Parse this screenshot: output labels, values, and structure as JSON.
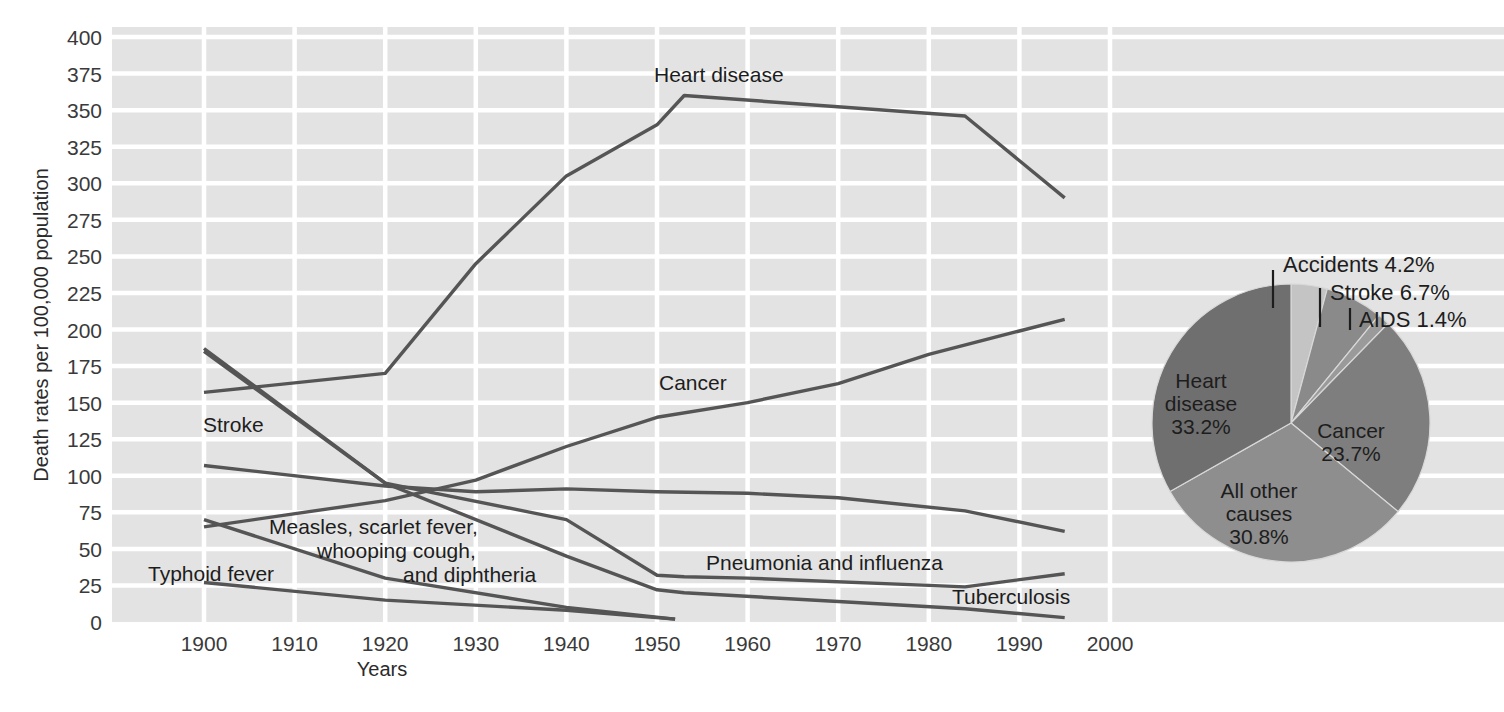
{
  "chart_data": [
    {
      "type": "line",
      "title": "",
      "xlabel": "Years",
      "ylabel": "Death rates per 100,000 population",
      "xlim": [
        1896,
        2004
      ],
      "ylim": [
        0,
        400
      ],
      "grid": true,
      "legend_position": "inline-labels",
      "xticks": [
        1900,
        1910,
        1920,
        1930,
        1940,
        1950,
        1960,
        1970,
        1980,
        1990,
        2000
      ],
      "yticks": [
        0,
        25,
        50,
        75,
        100,
        125,
        150,
        175,
        200,
        225,
        250,
        275,
        300,
        325,
        350,
        375,
        400
      ],
      "series": [
        {
          "name": "Heart disease",
          "x": [
            1900,
            1920,
            1930,
            1940,
            1950,
            1953,
            1984,
            1995
          ],
          "values": [
            157,
            170,
            245,
            305,
            340,
            360,
            346,
            290
          ]
        },
        {
          "name": "Cancer",
          "x": [
            1900,
            1920,
            1930,
            1940,
            1950,
            1960,
            1970,
            1980,
            1995
          ],
          "values": [
            65,
            83,
            97,
            120,
            140,
            150,
            163,
            183,
            207
          ]
        },
        {
          "name": "Stroke",
          "x": [
            1900,
            1920,
            1930,
            1940,
            1950,
            1960,
            1970,
            1984,
            1995
          ],
          "values": [
            107,
            93,
            89,
            91,
            89,
            88,
            85,
            76,
            62
          ]
        },
        {
          "name": "Pneumonia and influenza",
          "x": [
            1900,
            1920,
            1940,
            1950,
            1953,
            1960,
            1980,
            1984,
            1995
          ],
          "values": [
            187,
            95,
            70,
            32,
            31,
            30,
            25,
            24,
            33
          ]
        },
        {
          "name": "Tuberculosis",
          "x": [
            1900,
            1920,
            1940,
            1950,
            1953,
            1970,
            1984,
            1995
          ],
          "values": [
            185,
            95,
            45,
            22,
            20,
            14,
            9,
            3
          ]
        },
        {
          "name": "Measles, scarlet fever, whooping cough, and diphtheria",
          "x": [
            1900,
            1920,
            1940,
            1952
          ],
          "values": [
            70,
            30,
            10,
            2
          ]
        },
        {
          "name": "Typhoid fever",
          "x": [
            1900,
            1920,
            1940,
            1952
          ],
          "values": [
            27,
            15,
            8,
            2
          ]
        }
      ]
    },
    {
      "type": "pie",
      "title": "",
      "labels": [
        "Accidents",
        "Stroke",
        "AIDS",
        "Cancer",
        "All other causes",
        "Heart disease"
      ],
      "values": [
        4.2,
        6.7,
        1.4,
        23.7,
        30.8,
        33.2
      ],
      "value_strings": [
        "4.2%",
        "6.7%",
        "1.4%",
        "23.7%",
        "30.8%",
        "33.2%"
      ],
      "legend_position": "on-slice-and-callout"
    }
  ],
  "axes": {
    "y_title": "Death rates per 100,000 population",
    "x_title": "Years",
    "y_ticks": [
      "400",
      "375",
      "350",
      "325",
      "300",
      "275",
      "250",
      "225",
      "200",
      "175",
      "150",
      "125",
      "100",
      "75",
      "50",
      "25",
      "0"
    ],
    "x_ticks": [
      "1900",
      "1910",
      "1920",
      "1930",
      "1940",
      "1950",
      "1960",
      "1970",
      "1980",
      "1990",
      "2000"
    ]
  },
  "line_labels": {
    "heart_disease": "Heart disease",
    "cancer": "Cancer",
    "stroke": "Stroke",
    "pneumonia": "Pneumonia and influenza",
    "tuberculosis": "Tuberculosis",
    "measles_line1": "Measles, scarlet fever,",
    "measles_line2": "whooping cough,",
    "measles_line3": "and diphtheria",
    "typhoid": "Typhoid fever"
  },
  "pie_labels": {
    "accidents": "Accidents 4.2%",
    "stroke": "Stroke 6.7%",
    "aids": "AIDS 1.4%",
    "cancer_name": "Cancer",
    "cancer_value": "23.7%",
    "heart_line1": "Heart",
    "heart_line2": "disease",
    "heart_value": "33.2%",
    "other_line1": "All other",
    "other_line2": "causes",
    "other_value": "30.8%"
  },
  "colors": {
    "plot_background": "#e3e3e3",
    "gridline": "#ffffff",
    "line_stroke": "#555555",
    "page_background": "#ffffff",
    "pie_heart_disease": "#6f6f6f",
    "pie_all_other": "#8e8e8e",
    "pie_cancer": "#7e7e7e",
    "pie_aids": "#9a9a9a",
    "pie_stroke": "#8a8a8a",
    "pie_accidents": "#c4c4c4"
  }
}
